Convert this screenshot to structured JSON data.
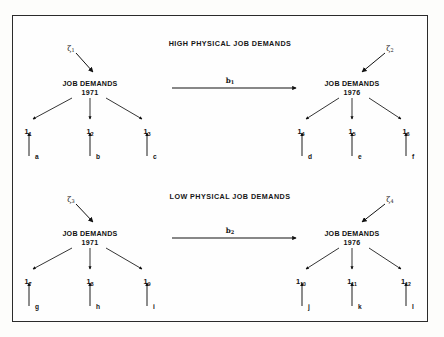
{
  "figure": {
    "type": "path-diagram",
    "background_color": "#fdfdfb",
    "border_color": "#2b2b2b",
    "ink_color": "#111111"
  },
  "panels": [
    {
      "id": "high",
      "title": "HIGH PHYSICAL JOB DEMANDS",
      "title_x": 230,
      "title_y": 39,
      "path": {
        "label": "b",
        "sub": "1",
        "x": 230,
        "y": 76,
        "line_y": 88,
        "x1": 172,
        "x2": 296
      },
      "nodes": [
        {
          "id": "high-1971",
          "name": "JOB DEMANDS",
          "year": "1971",
          "x": 90,
          "y": 80,
          "disturbance": {
            "label": "ζ",
            "sub": "1",
            "x": 71,
            "y": 44,
            "ax1": 76,
            "ay1": 53,
            "ax2": 93,
            "ay2": 72
          },
          "indicators": [
            {
              "label": "1",
              "sub": "1",
              "x": 28,
              "y": 127,
              "ax1": 72,
              "ay1": 98,
              "ax2": 33,
              "ay2": 119,
              "err": "a",
              "err_x": 35,
              "err_y": 153,
              "ex": 29,
              "ey1": 156,
              "ey2": 133
            },
            {
              "label": "1",
              "sub": "2",
              "x": 90,
              "y": 127,
              "ax1": 90,
              "ay1": 98,
              "ax2": 90,
              "ay2": 119,
              "err": "b",
              "err_x": 96,
              "err_y": 153,
              "ex": 90,
              "ey1": 156,
              "ey2": 133
            },
            {
              "label": "1",
              "sub": "3",
              "x": 147,
              "y": 127,
              "ax1": 106,
              "ay1": 98,
              "ax2": 142,
              "ay2": 119,
              "err": "c",
              "err_x": 153,
              "err_y": 153,
              "ex": 147,
              "ey1": 156,
              "ey2": 133
            }
          ]
        },
        {
          "id": "high-1976",
          "name": "JOB DEMANDS",
          "year": "1976",
          "x": 352,
          "y": 80,
          "disturbance": {
            "label": "ζ",
            "sub": "2",
            "x": 390,
            "y": 44,
            "ax1": 385,
            "ay1": 53,
            "ax2": 362,
            "ay2": 72
          },
          "indicators": [
            {
              "label": "1",
              "sub": "4",
              "x": 301,
              "y": 127,
              "ax1": 339,
              "ay1": 98,
              "ax2": 306,
              "ay2": 119,
              "err": "d",
              "err_x": 308,
              "err_y": 153,
              "ex": 302,
              "ey1": 156,
              "ey2": 133
            },
            {
              "label": "1",
              "sub": "5",
              "x": 352,
              "y": 127,
              "ax1": 352,
              "ay1": 98,
              "ax2": 352,
              "ay2": 119,
              "err": "e",
              "err_x": 358,
              "err_y": 153,
              "ex": 352,
              "ey1": 156,
              "ey2": 133
            },
            {
              "label": "1",
              "sub": "6",
              "x": 406,
              "y": 127,
              "ax1": 369,
              "ay1": 98,
              "ax2": 401,
              "ay2": 119,
              "err": "f",
              "err_x": 412,
              "err_y": 153,
              "ex": 406,
              "ey1": 156,
              "ey2": 133
            }
          ]
        }
      ]
    },
    {
      "id": "low",
      "title": "LOW PHYSICAL JOB DEMANDS",
      "title_x": 230,
      "title_y": 192,
      "path": {
        "label": "b",
        "sub": "2",
        "x": 230,
        "y": 226,
        "line_y": 238,
        "x1": 172,
        "x2": 296
      },
      "nodes": [
        {
          "id": "low-1971",
          "name": "JOB DEMANDS",
          "year": "1971",
          "x": 90,
          "y": 230,
          "disturbance": {
            "label": "ζ",
            "sub": "3",
            "x": 71,
            "y": 195,
            "ax1": 76,
            "ay1": 204,
            "ax2": 93,
            "ay2": 222
          },
          "indicators": [
            {
              "label": "1",
              "sub": "7",
              "x": 28,
              "y": 277,
              "ax1": 72,
              "ay1": 248,
              "ax2": 33,
              "ay2": 269,
              "err": "g",
              "err_x": 35,
              "err_y": 303,
              "ex": 29,
              "ey1": 306,
              "ey2": 283
            },
            {
              "label": "1",
              "sub": "8",
              "x": 90,
              "y": 277,
              "ax1": 90,
              "ay1": 248,
              "ax2": 90,
              "ay2": 269,
              "err": "h",
              "err_x": 96,
              "err_y": 303,
              "ex": 90,
              "ey1": 306,
              "ey2": 283
            },
            {
              "label": "1",
              "sub": "9",
              "x": 147,
              "y": 277,
              "ax1": 106,
              "ay1": 248,
              "ax2": 142,
              "ay2": 269,
              "err": "i",
              "err_x": 153,
              "err_y": 303,
              "ex": 147,
              "ey1": 306,
              "ey2": 283
            }
          ]
        },
        {
          "id": "low-1976",
          "name": "JOB DEMANDS",
          "year": "1976",
          "x": 352,
          "y": 230,
          "disturbance": {
            "label": "ζ",
            "sub": "4",
            "x": 390,
            "y": 195,
            "ax1": 385,
            "ay1": 204,
            "ax2": 362,
            "ay2": 222
          },
          "indicators": [
            {
              "label": "1",
              "sub": "10",
              "x": 301,
              "y": 277,
              "ax1": 339,
              "ay1": 248,
              "ax2": 306,
              "ay2": 269,
              "err": "j",
              "err_x": 308,
              "err_y": 303,
              "ex": 302,
              "ey1": 306,
              "ey2": 283
            },
            {
              "label": "1",
              "sub": "11",
              "x": 352,
              "y": 277,
              "ax1": 352,
              "ay1": 248,
              "ax2": 352,
              "ay2": 269,
              "err": "k",
              "err_x": 358,
              "err_y": 303,
              "ex": 352,
              "ey1": 306,
              "ey2": 283
            },
            {
              "label": "1",
              "sub": "12",
              "x": 406,
              "y": 277,
              "ax1": 369,
              "ay1": 248,
              "ax2": 401,
              "ay2": 269,
              "err": "l",
              "err_x": 412,
              "err_y": 303,
              "ex": 406,
              "ey1": 306,
              "ey2": 283
            }
          ]
        }
      ]
    }
  ]
}
